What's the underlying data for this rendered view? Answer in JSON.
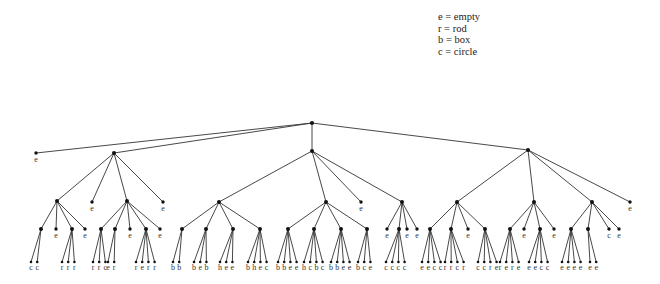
{
  "legend": [
    {
      "symbol": "e",
      "meaning": "empty",
      "text": "e = empty"
    },
    {
      "symbol": "r",
      "meaning": "rod",
      "text": "r = rod"
    },
    {
      "symbol": "b",
      "meaning": "box",
      "text": "b = box"
    },
    {
      "symbol": "c",
      "meaning": "circle",
      "text": "c = circle"
    }
  ],
  "tree": {
    "root": {
      "id": "root",
      "x": 312,
      "y": 123
    },
    "nodes": [
      {
        "id": "L1e",
        "parent": "root",
        "x": 36,
        "y": 153,
        "label": "e"
      },
      {
        "id": "A",
        "parent": "root",
        "x": 114,
        "y": 153
      },
      {
        "id": "B",
        "parent": "root",
        "x": 312,
        "y": 151
      },
      {
        "id": "C",
        "parent": "root",
        "x": 528,
        "y": 150
      },
      {
        "id": "A1",
        "parent": "A",
        "x": 57,
        "y": 201
      },
      {
        "id": "Ae1",
        "parent": "A",
        "x": 92,
        "y": 202,
        "label": "e"
      },
      {
        "id": "A2",
        "parent": "A",
        "x": 127,
        "y": 201
      },
      {
        "id": "Ae2",
        "parent": "A",
        "x": 163,
        "y": 202,
        "label": "e"
      },
      {
        "id": "B1",
        "parent": "B",
        "x": 219,
        "y": 202
      },
      {
        "id": "B2",
        "parent": "B",
        "x": 326,
        "y": 202
      },
      {
        "id": "Be1",
        "parent": "B",
        "x": 361,
        "y": 202,
        "label": "e"
      },
      {
        "id": "B3",
        "parent": "B",
        "x": 402,
        "y": 202
      },
      {
        "id": "C1",
        "parent": "C",
        "x": 457,
        "y": 202
      },
      {
        "id": "C2",
        "parent": "C",
        "x": 534,
        "y": 202
      },
      {
        "id": "C3",
        "parent": "C",
        "x": 592,
        "y": 202
      },
      {
        "id": "Ce1",
        "parent": "C",
        "x": 630,
        "y": 202,
        "label": "e"
      },
      {
        "id": "A1a",
        "parent": "A1",
        "x": 41,
        "y": 229
      },
      {
        "id": "A1b",
        "parent": "A1",
        "x": 56,
        "y": 229,
        "label": "e"
      },
      {
        "id": "A1c",
        "parent": "A1",
        "x": 72,
        "y": 229
      },
      {
        "id": "A1d",
        "parent": "A1",
        "x": 85,
        "y": 229,
        "label": "e"
      },
      {
        "id": "A2a",
        "parent": "A2",
        "x": 101,
        "y": 229
      },
      {
        "id": "A2b",
        "parent": "A2",
        "x": 115,
        "y": 229
      },
      {
        "id": "A2c",
        "parent": "A2",
        "x": 130,
        "y": 229,
        "label": "e"
      },
      {
        "id": "A2d",
        "parent": "A2",
        "x": 146,
        "y": 229
      },
      {
        "id": "A2e",
        "parent": "A2",
        "x": 160,
        "y": 229,
        "label": "e"
      },
      {
        "id": "B1a",
        "parent": "B1",
        "x": 182,
        "y": 229
      },
      {
        "id": "B1b",
        "parent": "B1",
        "x": 206,
        "y": 229
      },
      {
        "id": "B1c",
        "parent": "B1",
        "x": 233,
        "y": 229
      },
      {
        "id": "B1d",
        "parent": "B1",
        "x": 260,
        "y": 229
      },
      {
        "id": "B2a",
        "parent": "B2",
        "x": 288,
        "y": 229
      },
      {
        "id": "B2b",
        "parent": "B2",
        "x": 314,
        "y": 229
      },
      {
        "id": "B2c",
        "parent": "B2",
        "x": 341,
        "y": 229
      },
      {
        "id": "B2d",
        "parent": "B2",
        "x": 367,
        "y": 229
      },
      {
        "id": "B3a",
        "parent": "B3",
        "x": 387,
        "y": 229,
        "label": "e"
      },
      {
        "id": "B3b",
        "parent": "B3",
        "x": 399,
        "y": 229
      },
      {
        "id": "B3c",
        "parent": "B3",
        "x": 407,
        "y": 229,
        "label": "e"
      },
      {
        "id": "B3d",
        "parent": "B3",
        "x": 417,
        "y": 229,
        "label": "e"
      },
      {
        "id": "C1a",
        "parent": "C1",
        "x": 430,
        "y": 229
      },
      {
        "id": "C1b",
        "parent": "C1",
        "x": 451,
        "y": 229
      },
      {
        "id": "C1c",
        "parent": "C1",
        "x": 468,
        "y": 229,
        "label": "e"
      },
      {
        "id": "C1d",
        "parent": "C1",
        "x": 485,
        "y": 229
      },
      {
        "id": "C2a",
        "parent": "C2",
        "x": 510,
        "y": 229
      },
      {
        "id": "C2b",
        "parent": "C2",
        "x": 524,
        "y": 229,
        "label": "e"
      },
      {
        "id": "C2c",
        "parent": "C2",
        "x": 540,
        "y": 229
      },
      {
        "id": "C2d",
        "parent": "C2",
        "x": 554,
        "y": 229,
        "label": "e"
      },
      {
        "id": "C3a",
        "parent": "C3",
        "x": 571,
        "y": 229
      },
      {
        "id": "C3b",
        "parent": "C3",
        "x": 588,
        "y": 229
      },
      {
        "id": "C3c",
        "parent": "C3",
        "x": 609,
        "y": 229,
        "label": "c"
      },
      {
        "id": "C3d",
        "parent": "C3",
        "x": 619,
        "y": 229,
        "label": "e"
      }
    ],
    "leaf_rows": [
      {
        "parent": "A1a",
        "x0": 31,
        "labels": [
          "c",
          "c"
        ]
      },
      {
        "parent": "A1c",
        "x0": 62,
        "labels": [
          "r",
          "r",
          "r"
        ]
      },
      {
        "parent": "A2a",
        "x0": 93,
        "labels": [
          "r",
          "r",
          "c"
        ]
      },
      {
        "parent": "A2b",
        "x0": 108,
        "labels": [
          "e",
          "r"
        ]
      },
      {
        "parent": "A2d",
        "x0": 136,
        "labels": [
          "r",
          "e",
          "r",
          "r"
        ]
      },
      {
        "parent": "B1a",
        "x0": 173,
        "labels": [
          "b",
          "b"
        ]
      },
      {
        "parent": "B1b",
        "x0": 194,
        "labels": [
          "b",
          "e",
          "b"
        ]
      },
      {
        "parent": "B1c",
        "x0": 220,
        "labels": [
          "h",
          "e",
          "e"
        ]
      },
      {
        "parent": "B1d",
        "x0": 248,
        "labels": [
          "b",
          "h",
          "e",
          "c"
        ]
      },
      {
        "parent": "B2a",
        "x0": 278,
        "labels": [
          "b",
          "b",
          "e",
          "e"
        ]
      },
      {
        "parent": "B2b",
        "x0": 304,
        "labels": [
          "h",
          "c",
          "b",
          "c"
        ]
      },
      {
        "parent": "B2c",
        "x0": 331,
        "labels": [
          "b",
          "b",
          "e",
          "e"
        ]
      },
      {
        "parent": "B2d",
        "x0": 358,
        "labels": [
          "b",
          "c",
          "e"
        ]
      },
      {
        "parent": "B3b",
        "x0": 386,
        "labels": [
          "c",
          "c",
          "c",
          "c"
        ]
      },
      {
        "parent": "C1a",
        "x0": 422,
        "labels": [
          "e",
          "e",
          "c",
          "c"
        ]
      },
      {
        "parent": "C1b",
        "x0": 445,
        "labels": [
          "r",
          "r",
          "c",
          "r"
        ]
      },
      {
        "parent": "C1d",
        "x0": 478,
        "labels": [
          "c",
          "c",
          "r",
          "e"
        ]
      },
      {
        "parent": "C2a",
        "x0": 500,
        "labels": [
          "r",
          "e",
          "r",
          "e"
        ]
      },
      {
        "parent": "C2c",
        "x0": 529,
        "labels": [
          "e",
          "e",
          "c",
          "c"
        ]
      },
      {
        "parent": "C3a",
        "x0": 562,
        "labels": [
          "e",
          "e",
          "e",
          "e"
        ]
      },
      {
        "parent": "C3b",
        "x0": 590,
        "labels": [
          "e",
          "e"
        ]
      }
    ]
  }
}
